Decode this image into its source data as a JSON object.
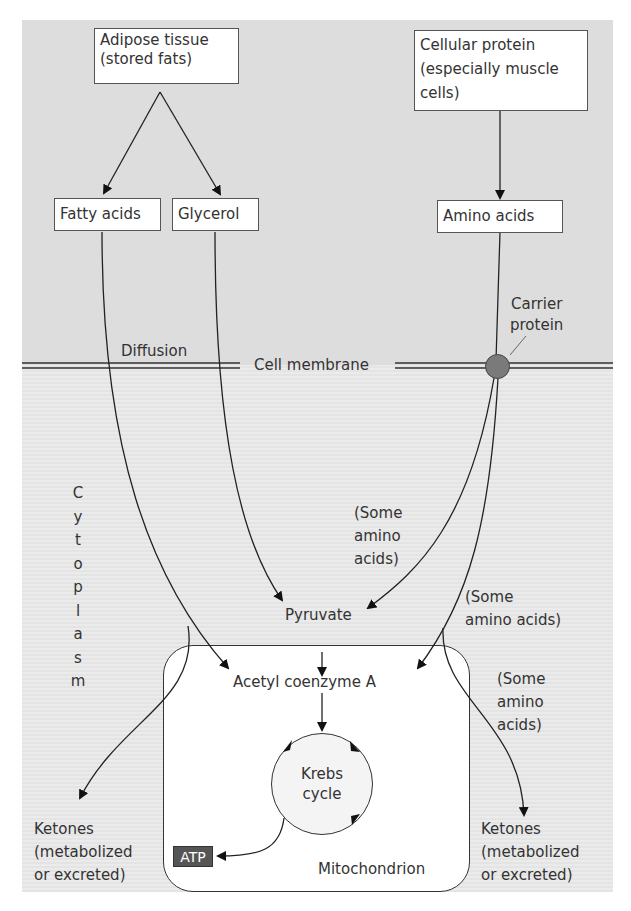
{
  "diagram": {
    "colors": {
      "extracellular_bg": "#dddddd",
      "cytoplasm_bg": "#e6e6e6",
      "carrier_protein": "#7a7a7a",
      "atp_box": "#555555"
    },
    "sources": {
      "adipose": [
        "Adipose tissue",
        "(stored fats)"
      ],
      "protein": [
        "Cellular protein",
        "(especially muscle",
        "cells)"
      ]
    },
    "intermediates": {
      "fatty_acids": "Fatty acids",
      "glycerol": "Glycerol",
      "amino_acids": "Amino acids"
    },
    "membrane": {
      "diffusion": "Diffusion",
      "cell_membrane": "Cell membrane",
      "carrier": [
        "Carrier",
        "protein"
      ]
    },
    "cytoplasm_label": [
      "C",
      "y",
      "t",
      "o",
      "p",
      "l",
      "a",
      "s",
      "m"
    ],
    "amino_notes": {
      "to_pyruvate": [
        "(Some",
        "amino",
        "acids)"
      ],
      "to_acetyl": [
        "(Some",
        "amino acids)"
      ],
      "to_ketones": [
        "(Some",
        "amino",
        "acids)"
      ]
    },
    "metabolites": {
      "pyruvate": "Pyruvate",
      "acetyl_coa": "Acetyl coenzyme A",
      "krebs": [
        "Krebs",
        "cycle"
      ],
      "atp": "ATP",
      "mitochondrion": "Mitochondrion"
    },
    "ketones_left": [
      "Ketones",
      "(metabolized",
      "or excreted)"
    ],
    "ketones_right": [
      "Ketones",
      "(metabolized",
      "or excreted)"
    ]
  }
}
